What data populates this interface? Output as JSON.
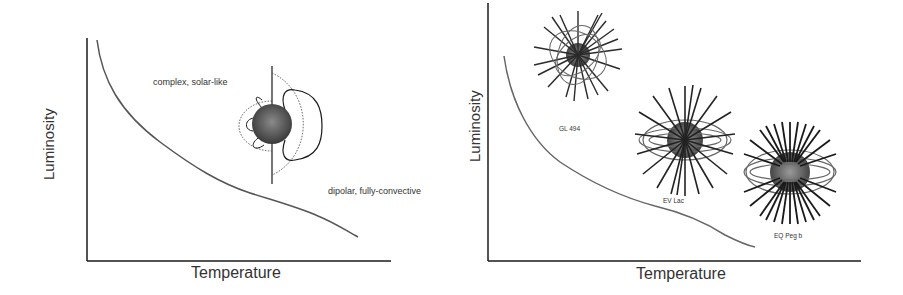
{
  "left_panel": {
    "xlabel": "Temperature",
    "ylabel": "Luminosity",
    "annotations": {
      "upper": "complex, solar-like",
      "lower": "dipolar, fully-convective"
    }
  },
  "right_panel": {
    "xlabel": "Temperature",
    "ylabel": "Luminosity",
    "stars": [
      {
        "name": "GL 494"
      },
      {
        "name": "EV Lac"
      },
      {
        "name": "EQ Peg b"
      }
    ]
  },
  "colors": {
    "axis": "#1a1a1a",
    "curve": "#555555",
    "star_sphere": "#555555",
    "field_lines": "#2a2a2a"
  }
}
